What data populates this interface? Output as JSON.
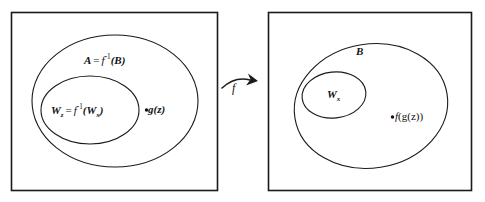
{
  "figure": {
    "type": "set-diagram",
    "background_color": "#ffffff",
    "stroke_color": "#1a1a1a"
  },
  "left_panel": {
    "name": "domain-box",
    "outer_ellipse_label": {
      "lhs": "A",
      "equals": "=",
      "fn": "f",
      "exponent": "-1",
      "arg": "(B)",
      "full_text": "A = f⁻¹(B)"
    },
    "inner_ellipse_label": {
      "lhs": "W",
      "lhs_subscript": "z",
      "equals": "=",
      "fn": "f",
      "exponent": "-1",
      "arg_open": "(",
      "arg": "W",
      "arg_subscript": "x",
      "arg_close": ")",
      "full_text": "W_z = f⁻¹(W_x)"
    },
    "point_label": {
      "marker": "•",
      "fn": "g",
      "arg": "(z)",
      "full_text": "•g(z)"
    }
  },
  "right_panel": {
    "name": "codomain-box",
    "outer_ellipse_label": {
      "text": "B"
    },
    "inner_ellipse_label": {
      "text": "W",
      "subscript": "x",
      "full_text": "W_x"
    },
    "point_label": {
      "marker": "•",
      "fn": "f",
      "arg": "(g(z))",
      "full_text": "•f(g(z))"
    }
  },
  "arrow": {
    "name": "map-arrow",
    "label": "f",
    "direction": "left-to-right"
  }
}
